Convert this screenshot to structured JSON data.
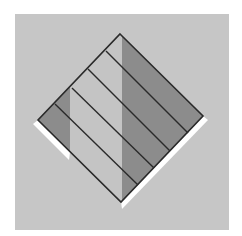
{
  "diagram": {
    "type": "abstract-geometric",
    "colors": {
      "page_background": "#ffffff",
      "panel_background": "#c6c6c6",
      "light_fill": "#c4c4c4",
      "dark_fill": "#8c8c8c",
      "outline": "#2a2a2a",
      "highlight": "#ffffff"
    },
    "panel": {
      "x": 15,
      "y": 14,
      "width": 214,
      "height": 216
    },
    "diamond": {
      "top": [
        120,
        34
      ],
      "right": [
        203,
        116
      ],
      "bottom": [
        121,
        202
      ],
      "left": [
        38,
        120
      ]
    },
    "stripe_lines": [
      {
        "from": [
          106,
          51
        ],
        "to": [
          188,
          133
        ]
      },
      {
        "from": [
          88,
          69
        ],
        "to": [
          170,
          151
        ]
      },
      {
        "from": [
          72,
          88
        ],
        "to": [
          154,
          168
        ]
      },
      {
        "from": [
          55,
          104
        ],
        "to": [
          138,
          185
        ]
      }
    ],
    "shaded_bands": [
      {
        "name": "left-band",
        "x_from": 38,
        "x_to": 70
      },
      {
        "name": "right-band",
        "x_from": 122,
        "x_to": 203
      }
    ]
  }
}
